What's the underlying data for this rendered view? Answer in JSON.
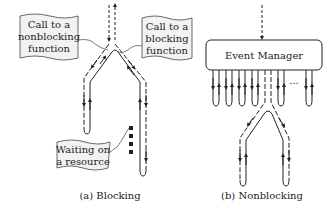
{
  "panels": {
    "blocking": {
      "caption": "(a) Blocking",
      "callouts": {
        "nonblocking_call": [
          "Call to a",
          "nonblocking",
          "function"
        ],
        "blocking_call": [
          "Call to a",
          "blocking",
          "function"
        ],
        "waiting": [
          "Waiting on",
          "a resource"
        ]
      }
    },
    "nonblocking": {
      "caption": "(b) Nonblocking",
      "event_manager_label": "Event Manager",
      "ellipsis": "..."
    }
  },
  "colors": {
    "stroke": "#222222",
    "callout_fill": "#f2f2f2",
    "background": "#ffffff"
  }
}
